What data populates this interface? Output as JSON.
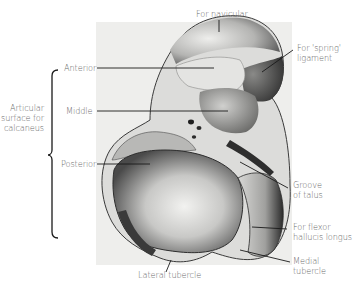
{
  "figure": {
    "labels": {
      "for_navicular": "For navicular",
      "for_spring_ligament_1": "For 'spring'",
      "for_spring_ligament_2": "ligament",
      "anterior": "Anterior",
      "middle": "Middle",
      "posterior": "Posterior",
      "articular_1": "Articular",
      "articular_2": "surface for",
      "articular_3": "calcaneus",
      "groove_1": "Groove",
      "groove_2": "of talus",
      "fhl_1": "For flexor",
      "fhl_2": "hallucis longus",
      "medial_1": "Medial",
      "medial_2": "tubercle",
      "lateral_tubercle": "Lateral tubercle"
    },
    "colors": {
      "label_text": "#6a6a6a",
      "leader_line": "#1a1a1a",
      "bone_light": "#e6e6e4",
      "bone_mid": "#9a9a98",
      "bone_dark": "#3a3a3a",
      "background_panel": "#eeeeec"
    }
  }
}
